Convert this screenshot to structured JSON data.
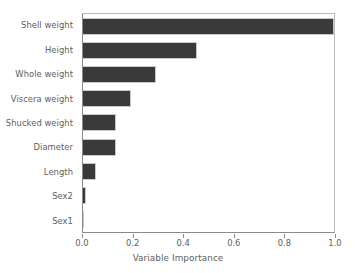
{
  "chart_data": {
    "type": "bar",
    "orientation": "horizontal",
    "title": "",
    "xlabel": "Variable Importance",
    "ylabel": "",
    "categories": [
      "Shell weight",
      "Height",
      "Whole weight",
      "Viscera weight",
      "Shucked weight",
      "Diameter",
      "Length",
      "Sex2",
      "Sex1"
    ],
    "values": [
      1.0,
      0.45,
      0.29,
      0.19,
      0.13,
      0.13,
      0.05,
      0.01,
      0.003
    ],
    "xlim": [
      0.0,
      1.0
    ],
    "xticks": [
      0.0,
      0.2,
      0.4,
      0.6,
      0.8,
      1.0
    ],
    "xtick_labels": [
      "0.0",
      "0.2",
      "0.4",
      "0.6",
      "0.8",
      "1.0"
    ],
    "grid": false,
    "legend": null,
    "bar_color": "#3a3a3a",
    "text_color": "#5d5d5d",
    "axis_color": "#8a8a8a",
    "background": "#ffffff"
  }
}
